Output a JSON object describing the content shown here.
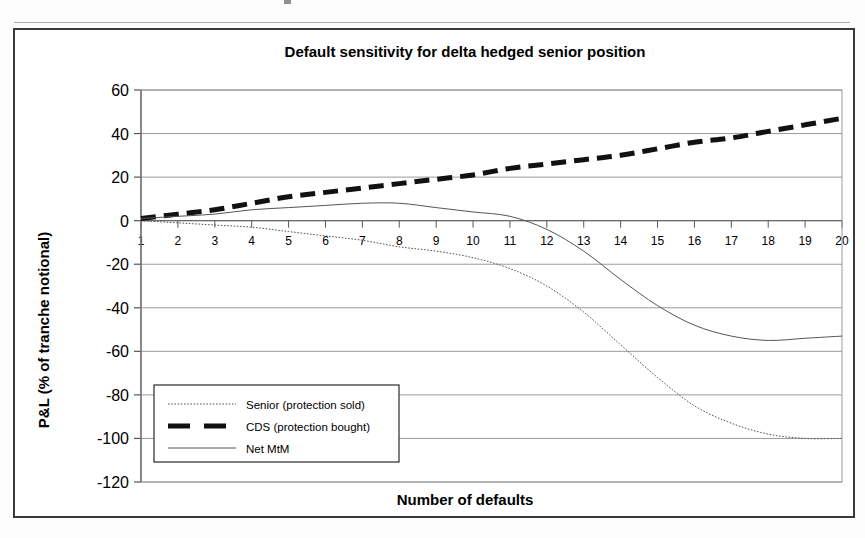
{
  "chart_data": {
    "type": "line",
    "title": "Default sensitivity for delta hedged senior position",
    "xlabel": "Number of defaults",
    "ylabel": "P&L (% of tranche notional)",
    "xlim": [
      1,
      20
    ],
    "ylim": [
      -120,
      60
    ],
    "ytick_step": 20,
    "grid": true,
    "legend_position": "inside-left-lower",
    "x": [
      1,
      2,
      3,
      4,
      5,
      6,
      7,
      8,
      9,
      10,
      11,
      12,
      13,
      14,
      15,
      16,
      17,
      18,
      19,
      20
    ],
    "xticklabels": [
      "1",
      "2",
      "3",
      "4",
      "5",
      "6",
      "7",
      "8",
      "9",
      "10",
      "11",
      "12",
      "13",
      "14",
      "15",
      "16",
      "17",
      "18",
      "19",
      "20"
    ],
    "yticklabels": [
      "60",
      "40",
      "20",
      "0",
      "-20",
      "-40",
      "-60",
      "-80",
      "-100",
      "-120"
    ],
    "yticks": [
      60,
      40,
      20,
      0,
      -20,
      -40,
      -60,
      -80,
      -100,
      -120
    ],
    "series": [
      {
        "name": "Senior (protection sold)",
        "style": "dotted-thin",
        "values": [
          0,
          -1,
          -2,
          -3,
          -5,
          -7,
          -9,
          -12,
          -14,
          -17,
          -22,
          -30,
          -42,
          -57,
          -72,
          -85,
          -93,
          -98,
          -100,
          -100
        ]
      },
      {
        "name": "CDS (protection bought)",
        "style": "thick-dashed",
        "values": [
          1,
          3,
          5,
          8,
          11,
          13,
          15,
          17,
          19,
          21,
          24,
          26,
          28,
          30,
          33,
          36,
          38,
          41,
          44,
          47
        ]
      },
      {
        "name": "Net MtM",
        "style": "thin-solid",
        "values": [
          1,
          2,
          3,
          5,
          6,
          7,
          8,
          8,
          6,
          4,
          2,
          -4,
          -14,
          -27,
          -39,
          -48,
          -53,
          -55,
          -54,
          -53
        ]
      }
    ]
  },
  "legend": {
    "items": [
      {
        "label": "Senior (protection sold)",
        "style": "dotted-thin"
      },
      {
        "label": "CDS (protection bought)",
        "style": "thick-dashed"
      },
      {
        "label": "Net MtM",
        "style": "thin-solid"
      }
    ]
  },
  "colors": {
    "line": "#4a4a4a",
    "emphasis": "#111111",
    "grid": "#9a9a9a",
    "frame": "#3a3a3a",
    "text": "#000000",
    "background": "#ffffff"
  }
}
